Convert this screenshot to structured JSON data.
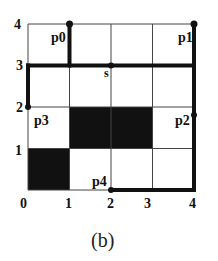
{
  "figure": {
    "caption": "(b)",
    "grid": {
      "x_ticks": [
        "0",
        "1",
        "2",
        "3",
        "4"
      ],
      "y_ticks": [
        "0",
        "1",
        "2",
        "3",
        "4"
      ],
      "origin_px": [
        28,
        190
      ],
      "cell_px": 41.5
    },
    "filled_cells": [
      {
        "x": 0,
        "y": 0
      },
      {
        "x": 1,
        "y": 1
      },
      {
        "x": 2,
        "y": 1
      }
    ],
    "points": [
      {
        "name": "p0",
        "label": "p0",
        "x": 1,
        "y": 4
      },
      {
        "name": "p1",
        "label": "p1",
        "x": 4,
        "y": 4
      },
      {
        "name": "p2",
        "label": "p2",
        "x": 4,
        "y": 1.6
      },
      {
        "name": "p3",
        "label": "p3",
        "x": 0,
        "y": 2
      },
      {
        "name": "p4",
        "label": "p4",
        "x": 2,
        "y": 0
      },
      {
        "name": "s",
        "label": "s",
        "x": 2,
        "y": 3
      }
    ],
    "paths": [
      {
        "name": "path-p0-to-row3",
        "from": [
          1,
          4
        ],
        "to": [
          1,
          3
        ]
      },
      {
        "name": "path-row3",
        "from": [
          0,
          3
        ],
        "to": [
          4,
          3
        ]
      },
      {
        "name": "path-left-column",
        "from": [
          0,
          3
        ],
        "to": [
          0,
          2
        ]
      },
      {
        "name": "path-right-column",
        "from": [
          4,
          4
        ],
        "to": [
          4,
          0
        ]
      },
      {
        "name": "path-bottom-row",
        "from": [
          2,
          0
        ],
        "to": [
          4,
          0
        ]
      }
    ],
    "colors": {
      "line": "#111111",
      "grid": "#444444",
      "fill": "#111111",
      "background": "#ffffff"
    }
  }
}
